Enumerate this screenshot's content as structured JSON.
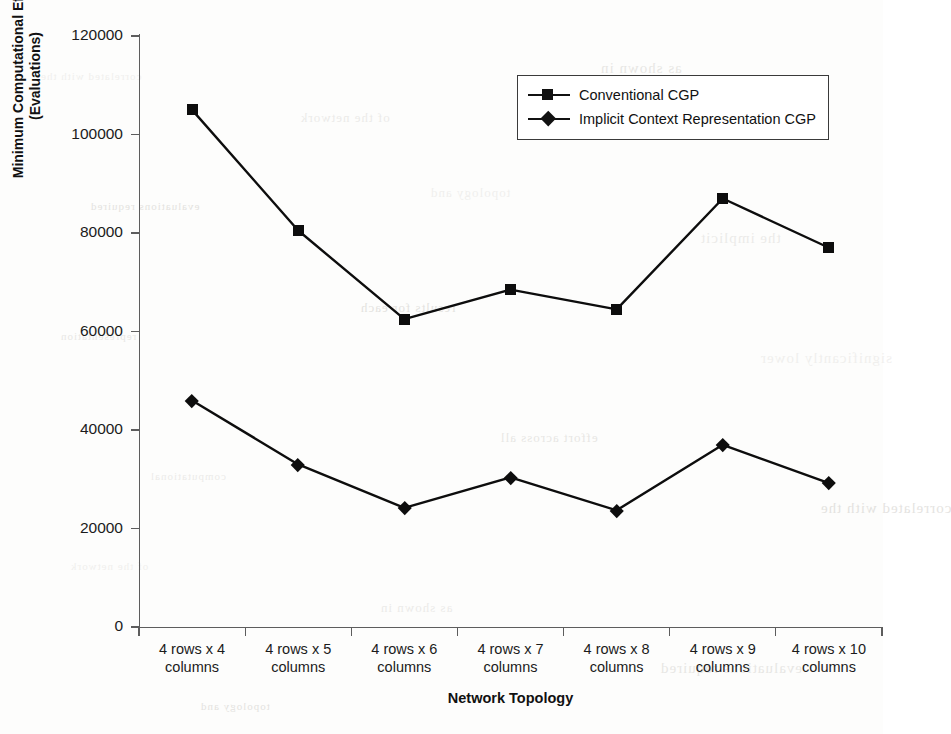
{
  "chart_data": {
    "type": "line",
    "title": "",
    "xlabel": "Network Topology",
    "ylabel_lines": [
      "Minimum Computational Effort",
      "(Evaluations)"
    ],
    "ylabel": "Minimum Computational Effort (Evaluations)",
    "categories": [
      "4 rows x 4 columns",
      "4 rows x 5 columns",
      "4 rows x 6 columns",
      "4 rows x 7 columns",
      "4 rows x 8 columns",
      "4 rows x 9 columns",
      "4 rows x 10 columns"
    ],
    "category_lines": [
      [
        "4 rows x 4",
        "columns"
      ],
      [
        "4 rows x 5",
        "columns"
      ],
      [
        "4 rows x 6",
        "columns"
      ],
      [
        "4 rows x 7",
        "columns"
      ],
      [
        "4 rows x 8",
        "columns"
      ],
      [
        "4 rows x 9",
        "columns"
      ],
      [
        "4 rows x 10",
        "columns"
      ]
    ],
    "series": [
      {
        "name": "Conventional CGP",
        "marker": "square",
        "color": "#0d0d0d",
        "values": [
          105000,
          80500,
          62500,
          68500,
          64500,
          87000,
          77000
        ]
      },
      {
        "name": "Implicit Context Representation CGP",
        "marker": "diamond",
        "color": "#0d0d0d",
        "values": [
          46000,
          33000,
          24200,
          30400,
          23700,
          37000,
          29200
        ]
      }
    ],
    "ylim": [
      0,
      120000
    ],
    "yticks": [
      0,
      20000,
      40000,
      60000,
      80000,
      100000,
      120000
    ],
    "ytick_labels": [
      "0",
      "20000",
      "40000",
      "60000",
      "80000",
      "100000",
      "120000"
    ],
    "grid": false,
    "legend_position": "top-right"
  },
  "legend": {
    "entries": [
      {
        "label": "Conventional CGP",
        "marker": "square-marker"
      },
      {
        "label": "Implicit Context Representation CGP",
        "marker": "diamond-marker"
      }
    ]
  },
  "axes": {
    "x_title": "Network Topology",
    "y_title_line1": "Minimum Computational Effort",
    "y_title_line2": "(Evaluations)"
  },
  "scan_artifacts": {
    "bleed_text": [
      "correlated with the",
      "of the network",
      "as shown in",
      "evaluations required",
      "topology and",
      "the implicit",
      "representation",
      "results for each",
      "significantly lower",
      "computational",
      "effort across all"
    ]
  }
}
